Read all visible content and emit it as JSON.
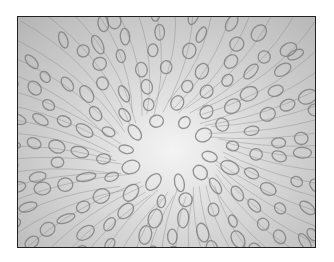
{
  "image": {
    "description": "Grayscale micrograph-like pattern of curved tubular strands with ring-shaped ellipses radiating around a bright central region, enclosed in a dark border frame",
    "palette": {
      "background": "#ffffff",
      "frame": "#222222",
      "center_light": "#f4f4f4",
      "edge_gray": "#b4b4b4",
      "stroke": "#7a7a7a"
    }
  }
}
